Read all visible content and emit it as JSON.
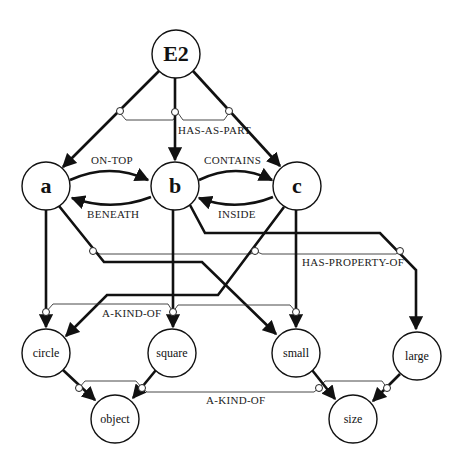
{
  "diagram": {
    "type": "semantic-network",
    "nodes": {
      "E2": {
        "label": "E2"
      },
      "a": {
        "label": "a"
      },
      "b": {
        "label": "b"
      },
      "c": {
        "label": "c"
      },
      "circle": {
        "label": "circle"
      },
      "square": {
        "label": "square"
      },
      "small": {
        "label": "small"
      },
      "large": {
        "label": "large"
      },
      "object": {
        "label": "object"
      },
      "size": {
        "label": "size"
      }
    },
    "relations": {
      "has_as_part": "HAS-AS-PART",
      "on_top": "ON-TOP",
      "beneath": "BENEATH",
      "contains": "CONTAINS",
      "inside": "INSIDE",
      "has_property_of": "HAS-PROPERTY-OF",
      "a_kind_of_1": "A-KIND-OF",
      "a_kind_of_2": "A-KIND-OF"
    },
    "edges": [
      {
        "from": "E2",
        "to": "a",
        "relation": "HAS-AS-PART"
      },
      {
        "from": "E2",
        "to": "b",
        "relation": "HAS-AS-PART"
      },
      {
        "from": "E2",
        "to": "c",
        "relation": "HAS-AS-PART"
      },
      {
        "from": "a",
        "to": "b",
        "relation": "ON-TOP"
      },
      {
        "from": "b",
        "to": "a",
        "relation": "BENEATH"
      },
      {
        "from": "b",
        "to": "c",
        "relation": "CONTAINS"
      },
      {
        "from": "c",
        "to": "b",
        "relation": "INSIDE"
      },
      {
        "from": "a",
        "to": "circle",
        "relation": "HAS-PROPERTY-OF"
      },
      {
        "from": "a",
        "to": "small",
        "relation": "HAS-PROPERTY-OF"
      },
      {
        "from": "b",
        "to": "square",
        "relation": "HAS-PROPERTY-OF"
      },
      {
        "from": "b",
        "to": "large",
        "relation": "HAS-PROPERTY-OF"
      },
      {
        "from": "c",
        "to": "circle",
        "relation": "HAS-PROPERTY-OF"
      },
      {
        "from": "c",
        "to": "small",
        "relation": "HAS-PROPERTY-OF"
      },
      {
        "from": "circle",
        "to": "object",
        "relation": "A-KIND-OF"
      },
      {
        "from": "square",
        "to": "object",
        "relation": "A-KIND-OF"
      },
      {
        "from": "small",
        "to": "size",
        "relation": "A-KIND-OF"
      },
      {
        "from": "large",
        "to": "size",
        "relation": "A-KIND-OF"
      }
    ]
  }
}
